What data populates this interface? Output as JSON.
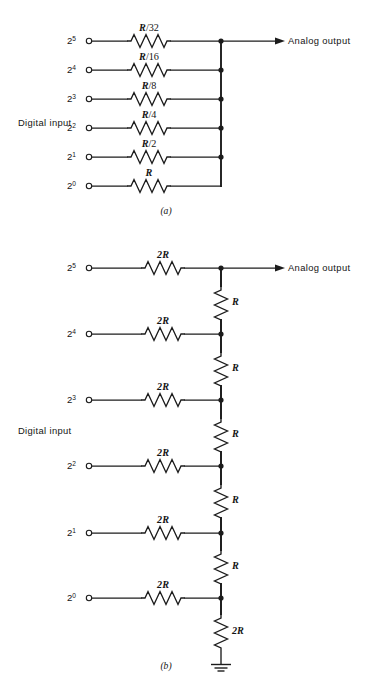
{
  "figure": {
    "background_color": "#ffffff",
    "ink_color": "#1c1c1c"
  },
  "panel_a": {
    "caption": "(a)",
    "input_group_label": "Digital input",
    "output_label": "Analog output",
    "rows": [
      {
        "bit_base": "2",
        "bit_exp": "5",
        "resistor": "R/32",
        "resistor_num": "R",
        "resistor_den": "/32"
      },
      {
        "bit_base": "2",
        "bit_exp": "4",
        "resistor": "R/16",
        "resistor_num": "R",
        "resistor_den": "/16"
      },
      {
        "bit_base": "2",
        "bit_exp": "3",
        "resistor": "R/8",
        "resistor_num": "R",
        "resistor_den": "/8"
      },
      {
        "bit_base": "2",
        "bit_exp": "2",
        "resistor": "R/4",
        "resistor_num": "R",
        "resistor_den": "/4"
      },
      {
        "bit_base": "2",
        "bit_exp": "1",
        "resistor": "R/2",
        "resistor_num": "R",
        "resistor_den": "/2"
      },
      {
        "bit_base": "2",
        "bit_exp": "0",
        "resistor": "R",
        "resistor_num": "R",
        "resistor_den": ""
      }
    ]
  },
  "panel_b": {
    "caption": "(b)",
    "input_group_label": "Digital input",
    "output_label": "Analog output",
    "rows": [
      {
        "bit_base": "2",
        "bit_exp": "5",
        "resistor": "2R",
        "series_resistor": "R"
      },
      {
        "bit_base": "2",
        "bit_exp": "4",
        "resistor": "2R",
        "series_resistor": "R"
      },
      {
        "bit_base": "2",
        "bit_exp": "3",
        "resistor": "2R",
        "series_resistor": "R"
      },
      {
        "bit_base": "2",
        "bit_exp": "2",
        "resistor": "2R",
        "series_resistor": "R"
      },
      {
        "bit_base": "2",
        "bit_exp": "1",
        "resistor": "2R",
        "series_resistor": "R"
      },
      {
        "bit_base": "2",
        "bit_exp": "0",
        "resistor": "2R",
        "series_resistor": null
      }
    ],
    "terminating_resistor": "2R",
    "ground_symbol": "earth-ground"
  }
}
